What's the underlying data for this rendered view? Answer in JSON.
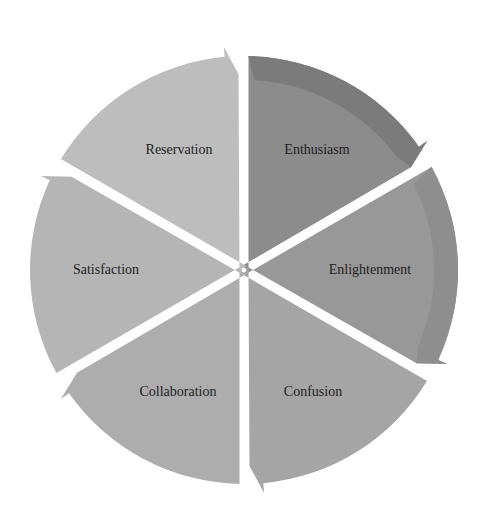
{
  "diagram": {
    "type": "cycle",
    "center": [
      244,
      270
    ],
    "radius": 222,
    "segments": [
      {
        "label": "Enthusiasm",
        "start_deg": -90,
        "end_deg": -30,
        "color": "#8c8c8c",
        "accent": "#7b7b7b",
        "label_pos": [
          317,
          154
        ]
      },
      {
        "label": "Enlightenment",
        "start_deg": -30,
        "end_deg": 30,
        "color": "#989898",
        "accent": "#8e8e8e",
        "label_pos": [
          370,
          274
        ]
      },
      {
        "label": "Confusion",
        "start_deg": 30,
        "end_deg": 90,
        "color": "#a5a5a5",
        "accent": "#a5a5a5",
        "label_pos": [
          313,
          396
        ]
      },
      {
        "label": "Collaboration",
        "start_deg": 90,
        "end_deg": 150,
        "color": "#adadad",
        "accent": "#adadad",
        "label_pos": [
          178,
          396
        ]
      },
      {
        "label": "Satisfaction",
        "start_deg": 150,
        "end_deg": 210,
        "color": "#b5b5b5",
        "accent": "#b5b5b5",
        "label_pos": [
          106,
          274
        ]
      },
      {
        "label": "Reservation",
        "start_deg": 210,
        "end_deg": 270,
        "color": "#bdbdbd",
        "accent": "#bdbdbd",
        "label_pos": [
          179,
          154
        ]
      }
    ]
  }
}
